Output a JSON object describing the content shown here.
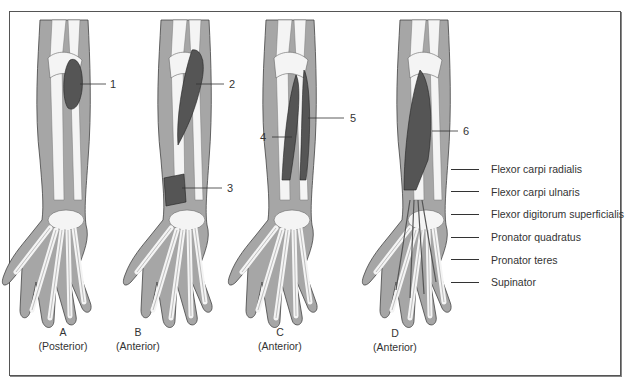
{
  "figure": {
    "panels": [
      {
        "letter": "A",
        "view": "(Posterior)"
      },
      {
        "letter": "B",
        "view": "(Anterior)"
      },
      {
        "letter": "C",
        "view": "(Anterior)"
      },
      {
        "letter": "D",
        "view": "(Anterior)"
      }
    ],
    "callouts": [
      "1",
      "2",
      "3",
      "4",
      "5",
      "6"
    ],
    "legend": [
      "Flexor carpi radialis",
      "Flexor carpi ulnaris",
      "Flexor digitorum superficialis",
      "Pronator quadratus",
      "Pronator teres",
      "Supinator"
    ],
    "colors": {
      "skin": "#a6a6a6",
      "bone": "#f4f4f4",
      "muscle": "#555555",
      "border": "#555555"
    }
  }
}
